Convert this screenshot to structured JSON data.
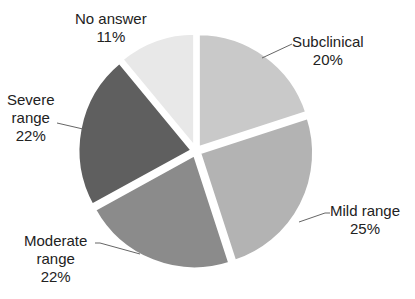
{
  "chart_data": {
    "type": "pie",
    "title": "",
    "categories": [
      "Subclinical",
      "Mild range",
      "Moderate range",
      "Severe range",
      "No answer"
    ],
    "values": [
      20,
      25,
      22,
      22,
      11
    ],
    "unit": "%",
    "colors": [
      "#c9c9c9",
      "#b3b3b3",
      "#8b8b8b",
      "#5f5f5f",
      "#e8e8e8"
    ],
    "exploded": true,
    "start_angle_deg": 0,
    "direction": "clockwise",
    "legend": "none",
    "data_labels": "category and percentage, outside with leader lines"
  },
  "labels": [
    {
      "line1": "Subclinical",
      "line2": "20%"
    },
    {
      "line1": "Mild range",
      "line2": "25%"
    },
    {
      "line1": "Moderate",
      "line1b": "range",
      "line2": "22%"
    },
    {
      "line1": "Severe",
      "line1b": "range",
      "line2": "22%"
    },
    {
      "line1": "No answer",
      "line2": "11%"
    }
  ]
}
